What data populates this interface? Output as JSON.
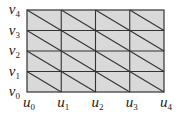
{
  "diagram": {
    "type": "triangulated-grid",
    "grid": {
      "left": 27,
      "top": 10,
      "right": 164,
      "bottom": 92,
      "cols": 4,
      "rows": 4,
      "fill": "#d9d9d9",
      "line_color": "#333333"
    },
    "u_labels": [
      {
        "base": "u",
        "sub": "0"
      },
      {
        "base": "u",
        "sub": "1"
      },
      {
        "base": "u",
        "sub": "2"
      },
      {
        "base": "u",
        "sub": "3"
      },
      {
        "base": "u",
        "sub": "4"
      }
    ],
    "v_labels": [
      {
        "base": "v",
        "sub": "0"
      },
      {
        "base": "v",
        "sub": "1"
      },
      {
        "base": "v",
        "sub": "2"
      },
      {
        "base": "v",
        "sub": "3"
      },
      {
        "base": "v",
        "sub": "4"
      }
    ]
  }
}
